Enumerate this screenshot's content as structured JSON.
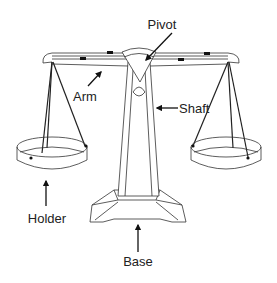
{
  "diagram": {
    "labels": {
      "pivot": "Pivot",
      "arm": "Arm",
      "shaft": "Shaft",
      "holder": "Holder",
      "base": "Base"
    },
    "colors": {
      "line": "#333333",
      "arrow": "#111111",
      "background": "#ffffff"
    }
  }
}
